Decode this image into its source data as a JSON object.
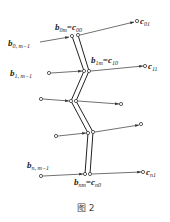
{
  "figure": {
    "caption": "图 2",
    "labels": {
      "b0_m1": {
        "base": "b",
        "sub": "0, m−1"
      },
      "b0m_c00": {
        "base": "b",
        "sub": "0m",
        "eq": "=",
        "base2": "c",
        "sub2": "00"
      },
      "c01": {
        "base": "c",
        "sub": "01"
      },
      "b1_m1": {
        "base": "b",
        "sub": "1, m−1"
      },
      "b1m_c10": {
        "base": "b",
        "sub": "1m",
        "eq": "=",
        "base2": "c",
        "sub2": "10"
      },
      "c11": {
        "base": "c",
        "sub": "11"
      },
      "bn_m1": {
        "base": "b",
        "sub": "n, m−1"
      },
      "bnm_cn0": {
        "base": "b",
        "sub": "nm",
        "eq": "=",
        "base2": "c",
        "sub2": "n0"
      },
      "cn1": {
        "base": "c",
        "sub": "n1"
      }
    }
  }
}
